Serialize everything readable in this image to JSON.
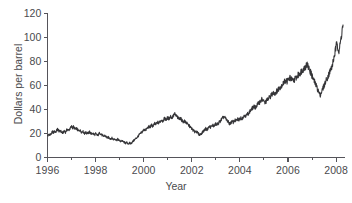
{
  "chart_data": {
    "type": "line",
    "title": "",
    "xlabel": "Year",
    "ylabel": "Dollars per barrel",
    "xlim": [
      1996,
      2008.35
    ],
    "ylim": [
      0,
      120
    ],
    "grid": false,
    "legend": "none",
    "line_color": "#353538",
    "axis_color": "#55545a",
    "yticks": [
      0,
      20,
      40,
      60,
      80,
      100,
      120
    ],
    "ytick_labels": [
      "0",
      "20",
      "40",
      "60",
      "80",
      "100",
      "120"
    ],
    "xticks": [
      1996,
      1998,
      2000,
      2002,
      2004,
      2006,
      2008
    ],
    "xtick_labels": [
      "1996",
      "1998",
      "2000",
      "2002",
      "2004",
      "2006",
      "2008"
    ],
    "xticks_minor": [
      1997,
      1999,
      2001,
      2003,
      2005,
      2007
    ],
    "series": [
      {
        "name": "Crude oil price",
        "x": [
          1996.0,
          1996.04,
          1996.08,
          1996.12,
          1996.17,
          1996.21,
          1996.25,
          1996.29,
          1996.33,
          1996.38,
          1996.42,
          1996.46,
          1996.5,
          1996.54,
          1996.58,
          1996.62,
          1996.67,
          1996.71,
          1996.75,
          1996.79,
          1996.83,
          1996.88,
          1996.92,
          1996.96,
          1997.0,
          1997.04,
          1997.08,
          1997.12,
          1997.17,
          1997.21,
          1997.25,
          1997.29,
          1997.33,
          1997.38,
          1997.42,
          1997.46,
          1997.5,
          1997.54,
          1997.58,
          1997.62,
          1997.67,
          1997.71,
          1997.75,
          1997.79,
          1997.83,
          1997.88,
          1997.92,
          1997.96,
          1998.0,
          1998.04,
          1998.08,
          1998.12,
          1998.17,
          1998.21,
          1998.25,
          1998.29,
          1998.33,
          1998.38,
          1998.42,
          1998.46,
          1998.5,
          1998.54,
          1998.58,
          1998.62,
          1998.67,
          1998.71,
          1998.75,
          1998.79,
          1998.83,
          1998.88,
          1998.92,
          1998.96,
          1999.0,
          1999.04,
          1999.08,
          1999.12,
          1999.17,
          1999.21,
          1999.25,
          1999.29,
          1999.33,
          1999.38,
          1999.42,
          1999.46,
          1999.5,
          1999.54,
          1999.58,
          1999.62,
          1999.67,
          1999.71,
          1999.75,
          1999.79,
          1999.83,
          1999.88,
          1999.92,
          1999.96,
          2000.0,
          2000.04,
          2000.08,
          2000.12,
          2000.17,
          2000.21,
          2000.25,
          2000.29,
          2000.33,
          2000.38,
          2000.42,
          2000.46,
          2000.5,
          2000.54,
          2000.58,
          2000.62,
          2000.67,
          2000.71,
          2000.75,
          2000.79,
          2000.83,
          2000.88,
          2000.92,
          2000.96,
          2001.0,
          2001.04,
          2001.08,
          2001.12,
          2001.17,
          2001.21,
          2001.25,
          2001.29,
          2001.33,
          2001.38,
          2001.42,
          2001.46,
          2001.5,
          2001.54,
          2001.58,
          2001.62,
          2001.67,
          2001.71,
          2001.75,
          2001.79,
          2001.83,
          2001.88,
          2001.92,
          2001.96,
          2002.0,
          2002.04,
          2002.08,
          2002.12,
          2002.17,
          2002.21,
          2002.25,
          2002.29,
          2002.33,
          2002.38,
          2002.42,
          2002.46,
          2002.5,
          2002.54,
          2002.58,
          2002.62,
          2002.67,
          2002.71,
          2002.75,
          2002.79,
          2002.83,
          2002.88,
          2002.92,
          2002.96,
          2003.0,
          2003.04,
          2003.08,
          2003.12,
          2003.17,
          2003.21,
          2003.25,
          2003.29,
          2003.33,
          2003.38,
          2003.42,
          2003.46,
          2003.5,
          2003.54,
          2003.58,
          2003.62,
          2003.67,
          2003.71,
          2003.75,
          2003.79,
          2003.83,
          2003.88,
          2003.92,
          2003.96,
          2004.0,
          2004.04,
          2004.08,
          2004.12,
          2004.17,
          2004.21,
          2004.25,
          2004.29,
          2004.33,
          2004.38,
          2004.42,
          2004.46,
          2004.5,
          2004.54,
          2004.58,
          2004.62,
          2004.67,
          2004.71,
          2004.75,
          2004.79,
          2004.83,
          2004.88,
          2004.92,
          2004.96,
          2005.0,
          2005.04,
          2005.08,
          2005.12,
          2005.17,
          2005.21,
          2005.25,
          2005.29,
          2005.33,
          2005.38,
          2005.42,
          2005.46,
          2005.5,
          2005.54,
          2005.58,
          2005.62,
          2005.67,
          2005.71,
          2005.75,
          2005.79,
          2005.83,
          2005.88,
          2005.92,
          2005.96,
          2006.0,
          2006.04,
          2006.08,
          2006.12,
          2006.17,
          2006.21,
          2006.25,
          2006.29,
          2006.33,
          2006.38,
          2006.42,
          2006.46,
          2006.5,
          2006.54,
          2006.58,
          2006.62,
          2006.67,
          2006.71,
          2006.75,
          2006.79,
          2006.83,
          2006.88,
          2006.92,
          2006.96,
          2007.0,
          2007.04,
          2007.08,
          2007.12,
          2007.17,
          2007.21,
          2007.25,
          2007.29,
          2007.33,
          2007.38,
          2007.42,
          2007.46,
          2007.5,
          2007.54,
          2007.58,
          2007.62,
          2007.67,
          2007.71,
          2007.75,
          2007.79,
          2007.83,
          2007.88,
          2007.92,
          2007.96,
          2008.0,
          2008.04,
          2008.08,
          2008.12,
          2008.17,
          2008.21,
          2008.25,
          2008.29
        ],
        "y": [
          18.0,
          18.6,
          19.4,
          18.9,
          20.2,
          21.5,
          20.6,
          22.0,
          21.1,
          22.4,
          23.6,
          22.6,
          21.5,
          22.3,
          21.2,
          20.4,
          21.3,
          22.0,
          21.2,
          22.6,
          23.4,
          22.5,
          23.8,
          24.6,
          25.8,
          24.9,
          25.6,
          24.4,
          23.3,
          24.2,
          23.0,
          22.1,
          23.0,
          22.0,
          21.2,
          22.1,
          21.0,
          20.1,
          21.0,
          20.2,
          21.1,
          20.3,
          21.2,
          20.4,
          19.6,
          20.4,
          19.6,
          18.9,
          19.8,
          19.0,
          18.3,
          19.1,
          20.6,
          19.8,
          19.0,
          18.2,
          17.5,
          18.3,
          17.6,
          16.9,
          16.2,
          16.9,
          16.2,
          15.6,
          16.3,
          15.6,
          15.0,
          15.7,
          15.1,
          14.5,
          15.2,
          14.6,
          14.0,
          13.4,
          14.1,
          13.5,
          13.0,
          12.4,
          11.9,
          12.5,
          11.9,
          11.4,
          12.1,
          11.6,
          12.4,
          13.2,
          14.0,
          14.8,
          15.7,
          16.5,
          17.4,
          18.3,
          19.2,
          20.1,
          21.0,
          21.9,
          22.8,
          23.6,
          22.7,
          23.8,
          24.8,
          25.8,
          24.9,
          26.0,
          27.0,
          26.1,
          27.2,
          28.2,
          27.3,
          28.4,
          29.4,
          28.5,
          29.6,
          30.6,
          31.6,
          30.5,
          31.6,
          32.6,
          31.5,
          32.3,
          33.1,
          32.2,
          33.2,
          34.2,
          33.1,
          34.2,
          35.2,
          36.2,
          35.1,
          34.1,
          33.1,
          32.2,
          33.2,
          32.2,
          31.3,
          30.4,
          29.5,
          30.4,
          29.4,
          28.5,
          27.6,
          26.7,
          25.8,
          24.9,
          24.0,
          23.1,
          22.2,
          21.3,
          22.2,
          21.3,
          20.4,
          19.5,
          18.8,
          19.6,
          20.5,
          21.4,
          22.3,
          23.2,
          24.1,
          23.2,
          24.2,
          25.1,
          26.0,
          25.1,
          26.1,
          27.0,
          26.1,
          27.1,
          28.0,
          27.1,
          28.1,
          29.0,
          30.0,
          31.0,
          32.0,
          33.0,
          34.0,
          33.0,
          32.0,
          31.0,
          30.0,
          29.0,
          28.0,
          29.0,
          30.0,
          29.1,
          30.1,
          31.1,
          30.2,
          31.2,
          32.2,
          31.3,
          32.3,
          33.3,
          32.4,
          33.4,
          34.4,
          35.4,
          34.5,
          35.5,
          36.5,
          37.5,
          38.5,
          39.5,
          40.5,
          41.5,
          42.5,
          41.5,
          42.5,
          43.5,
          44.5,
          45.5,
          46.5,
          47.5,
          48.5,
          47.5,
          46.5,
          45.5,
          46.5,
          47.5,
          48.5,
          49.5,
          50.5,
          51.5,
          52.5,
          53.5,
          54.5,
          53.5,
          54.5,
          55.5,
          56.5,
          57.5,
          58.5,
          59.5,
          60.5,
          61.5,
          62.5,
          63.5,
          64.5,
          63.5,
          64.5,
          65.5,
          66.5,
          65.5,
          64.5,
          63.5,
          64.5,
          65.5,
          66.5,
          67.5,
          68.5,
          69.5,
          70.5,
          71.5,
          72.5,
          73.5,
          74.5,
          75.5,
          76.5,
          77.5,
          76.0,
          74.0,
          72.0,
          70.0,
          68.0,
          66.0,
          64.0,
          62.0,
          60.0,
          58.0,
          56.0,
          54.0,
          52.0,
          54.0,
          56.0,
          58.0,
          60.0,
          62.0,
          64.0,
          66.0,
          68.0,
          70.0,
          72.0,
          74.0,
          76.0,
          80.0,
          84.0,
          88.0,
          92.0,
          96.0,
          92.0,
          88.0,
          94.0,
          100.0,
          106.0,
          110.5
        ]
      }
    ]
  }
}
